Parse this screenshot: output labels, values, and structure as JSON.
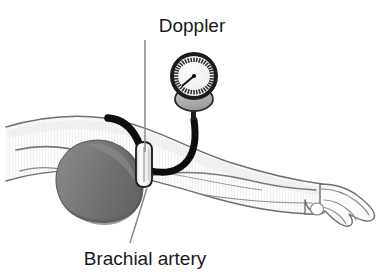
{
  "figure": {
    "background_color": "#ffffff",
    "width": 389,
    "height": 274
  },
  "labels": {
    "top": {
      "text": "Doppler",
      "x": 192,
      "y": 32,
      "anchor": "middle",
      "leader_from": [
        145,
        40
      ],
      "leader_to": [
        145,
        152
      ]
    },
    "bottom": {
      "text": "Brachial artery",
      "x": 145,
      "y": 265,
      "anchor": "middle",
      "leader_from": [
        130,
        243
      ],
      "leader_to": [
        147,
        188
      ]
    }
  },
  "colors": {
    "outline": "#6b6b6b",
    "skin_fill": "#fbfbfb",
    "skin_shade": "#e8e8e8",
    "cuff_fill": "#7d7d7d",
    "cuff_shade": "#6a6a6a",
    "cuff_highlight": "#9a9a9a",
    "tube_black": "#0d0d0d",
    "gauge_rim": "#1c1c1c",
    "gauge_face": "#f2f2f2",
    "gauge_tick": "#2b2b2b",
    "gauge_needle": "#111111",
    "bulb_fill": "#b5b5b5",
    "bulb_outline": "#2a2a2a",
    "probe_fill": "#fafafa",
    "probe_outline": "#1a1a1a",
    "label_text": "#1a1a1a",
    "leader_line": "#8a8a8a"
  },
  "parts": {
    "arm": {
      "name": "patient-arm",
      "description": "Horizontal right arm extending from shoulder at left to hand at right"
    },
    "hand": {
      "name": "patient-hand",
      "description": "Relaxed hand with curled fingers at right end of arm"
    },
    "cuff": {
      "name": "blood-pressure-cuff",
      "description": "Dark gray inflatable cuff wrapped around upper arm"
    },
    "probe": {
      "name": "doppler-probe",
      "description": "White capsule-shaped ultrasound probe over the brachial artery"
    },
    "gauge": {
      "name": "pressure-gauge",
      "description": "Round aneroid manometer dial with radial ticks and needle",
      "needle_angle_degrees": 221,
      "tick_count": 36
    },
    "bulb": {
      "name": "inflation-bulb",
      "description": "Gray rounded bulb beneath the gauge dial"
    },
    "tube_left": {
      "name": "probe-cable",
      "description": "Thick black cable curving up and to the left from the probe"
    },
    "tube_right": {
      "name": "cuff-tubing",
      "description": "Thick black tube curving right from the probe up to the gauge bulb"
    }
  }
}
